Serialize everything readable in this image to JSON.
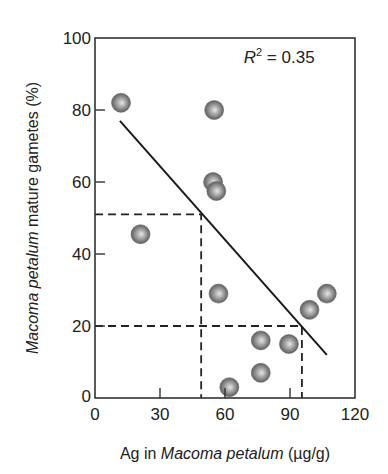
{
  "chart_data": {
    "type": "scatter",
    "title": "",
    "xlabel": "Ag in Macoma petalum (µg/g)",
    "xlabel_parts": [
      {
        "text": "Ag in ",
        "italic": false
      },
      {
        "text": "Macoma petalum",
        "italic": true
      },
      {
        "text": " (µg/g)",
        "italic": false
      }
    ],
    "ylabel": "Macoma petalum mature gametes (%)",
    "ylabel_parts": [
      {
        "text": "Macoma petalum",
        "italic": true
      },
      {
        "text": " mature gametes (%)",
        "italic": false
      }
    ],
    "xlim": [
      0,
      120
    ],
    "ylim": [
      0,
      100
    ],
    "xticks": [
      0,
      30,
      60,
      90,
      120
    ],
    "yticks": [
      0,
      20,
      40,
      60,
      80,
      100
    ],
    "grid": false,
    "legend": null,
    "series": [
      {
        "name": "samples",
        "marker": "shaded-sphere",
        "color": "#8a8a8a",
        "points": [
          {
            "x": 12,
            "y": 82
          },
          {
            "x": 55,
            "y": 80
          },
          {
            "x": 54.5,
            "y": 60
          },
          {
            "x": 56,
            "y": 57.5
          },
          {
            "x": 21,
            "y": 45.5
          },
          {
            "x": 57,
            "y": 29
          },
          {
            "x": 107,
            "y": 29
          },
          {
            "x": 99,
            "y": 24.5
          },
          {
            "x": 76.5,
            "y": 16
          },
          {
            "x": 89.5,
            "y": 15
          },
          {
            "x": 76.5,
            "y": 7
          },
          {
            "x": 62,
            "y": 3
          }
        ]
      }
    ],
    "regression_line": {
      "x1": 11.5,
      "y1": 77,
      "x2": 107,
      "y2": 12,
      "r_squared": 0.35
    },
    "reference_lines": [
      {
        "type": "dashed",
        "from": {
          "x": 0,
          "y": 51
        },
        "corner": {
          "x": 49,
          "y": 51
        },
        "to": {
          "x": 49,
          "y": 0
        }
      },
      {
        "type": "dashed",
        "from": {
          "x": 0,
          "y": 20
        },
        "corner": {
          "x": 95.5,
          "y": 20
        },
        "to": {
          "x": 95.5,
          "y": 0
        }
      }
    ],
    "annotations": [
      {
        "text": "R² = 0.35",
        "label_r": "R",
        "label_sup": "2",
        "label_rest": " = 0.35",
        "x": 85,
        "y": 93
      }
    ]
  }
}
